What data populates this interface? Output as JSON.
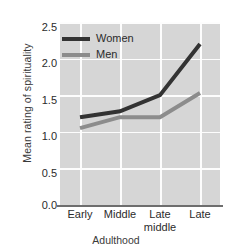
{
  "chart_data": {
    "type": "line",
    "title": "",
    "xlabel": "Adulthood",
    "ylabel": "Mean rating of spirituality",
    "categories": [
      "Early",
      "Middle",
      "Late middle",
      "Late"
    ],
    "category_lines": [
      [
        "Early"
      ],
      [
        "Middle"
      ],
      [
        "Late",
        "middle"
      ],
      [
        "Late"
      ]
    ],
    "ylim": [
      0.0,
      2.5
    ],
    "yticks": [
      "2.5",
      "2.0",
      "1.5",
      "1.0",
      "0.5",
      "0.0"
    ],
    "ytick_values": [
      2.5,
      2.0,
      1.5,
      1.0,
      0.5,
      0.0
    ],
    "grid": true,
    "legend_position": "upper-left-inside",
    "series": [
      {
        "name": "Women",
        "color": "#333333",
        "values": [
          1.2,
          1.28,
          1.5,
          2.2
        ]
      },
      {
        "name": "Men",
        "color": "#8c8c8c",
        "values": [
          1.05,
          1.2,
          1.2,
          1.53
        ]
      }
    ],
    "plot_background": "#d6d6d6",
    "gridline_color": "#fdfdfd",
    "axis_color": "#6e6e6e"
  }
}
